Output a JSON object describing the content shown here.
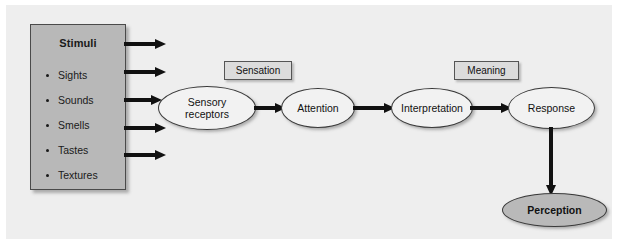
{
  "diagram": {
    "background_color": "#eeeeee",
    "page_color": "#ffffff"
  },
  "stimuli_box": {
    "title": "Stimuli",
    "fill_color": "#b8b8b8",
    "items": [
      {
        "label": "Sights"
      },
      {
        "label": "Sounds"
      },
      {
        "label": "Smells"
      },
      {
        "label": "Tastes"
      },
      {
        "label": "Textures"
      }
    ]
  },
  "stage_labels": [
    {
      "label": "Sensation"
    },
    {
      "label": "Meaning"
    }
  ],
  "nodes": [
    {
      "id": "sensory-receptors",
      "line1": "Sensory",
      "line2": "receptors",
      "fill_color": "#f2f2f2"
    },
    {
      "id": "attention",
      "line1": "Attention",
      "line2": "",
      "fill_color": "#f2f2f2"
    },
    {
      "id": "interpretation",
      "line1": "Interpretation",
      "line2": "",
      "fill_color": "#f2f2f2"
    },
    {
      "id": "response",
      "line1": "Response",
      "line2": "",
      "fill_color": "#f2f2f2"
    },
    {
      "id": "perception",
      "line1": "Perception",
      "line2": "",
      "fill_color": "#b9b9b9"
    }
  ],
  "arrows": {
    "stimuli_arrow_count": 5,
    "flow_arrow_count": 3,
    "vertical_arrow_count": 1,
    "color": "#111111"
  }
}
